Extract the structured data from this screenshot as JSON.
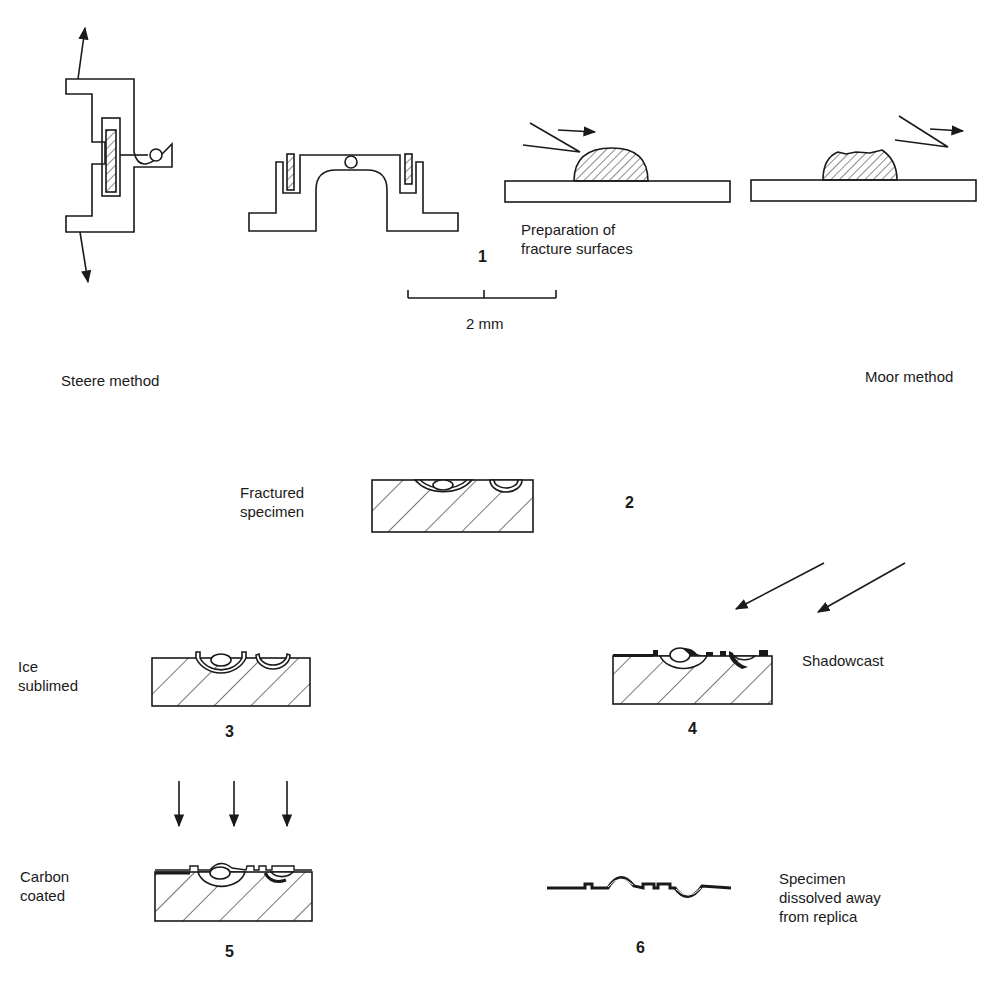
{
  "figure": {
    "panels": [
      {
        "id": 1,
        "number": "1",
        "caption": "Preparation of\nfracture surfaces"
      },
      {
        "id": 2,
        "number": "2",
        "caption": "Fractured\nspecimen"
      },
      {
        "id": 3,
        "number": "3",
        "caption": "Ice\nsublimed"
      },
      {
        "id": 4,
        "number": "4",
        "caption": "Shadowcast"
      },
      {
        "id": 5,
        "number": "5",
        "caption": "Carbon\ncoated"
      },
      {
        "id": 6,
        "number": "6",
        "caption": "Specimen\ndissolved away\nfrom replica"
      }
    ],
    "methods": {
      "left": "Steere method",
      "right": "Moor method"
    },
    "scale_bar": {
      "label": "2 mm"
    },
    "colors": {
      "ink": "#1a1a1a",
      "background": "#ffffff"
    }
  }
}
